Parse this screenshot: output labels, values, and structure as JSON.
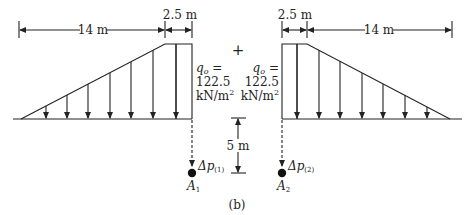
{
  "figure_label": "(b)",
  "operator": "+",
  "left_load": {
    "ramp_length": "14 m",
    "flat_width": "2.5 m",
    "q_symbol": "q",
    "q_subscript": "o",
    "q_eq": " =",
    "q_value": "122.5",
    "q_unit": "kN/m",
    "q_unit_exp": "2",
    "point_label": "A",
    "point_subscript": "1",
    "stress_label": "Δp",
    "stress_subscript": "(1)"
  },
  "right_load": {
    "ramp_length": "14 m",
    "flat_width": "2.5 m",
    "q_symbol": "q",
    "q_subscript": "o",
    "q_eq": " =",
    "q_value": "122.5",
    "q_unit": "kN/m",
    "q_unit_exp": "2",
    "point_label": "A",
    "point_subscript": "2",
    "stress_label": "Δp",
    "stress_subscript": "(2)"
  },
  "depth_label": "5 m"
}
